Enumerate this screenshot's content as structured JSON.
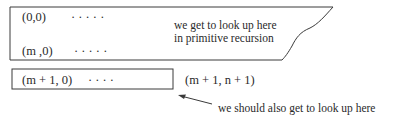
{
  "diagram": {
    "top_region": {
      "row_first": {
        "label": "(0,0)",
        "dots": "·   ·   ·   ·   ·"
      },
      "row_last": {
        "label": "(m ,0)",
        "dots": "·   ·   ·   ·   ·"
      },
      "annotation_line1": "we get to look up here",
      "annotation_line2": "in primitive recursion"
    },
    "bottom_row": {
      "label": "(m + 1, 0)",
      "dots": "·   ·   ·   ·",
      "target_label": "(m + 1, n + 1)"
    },
    "arrow_note": "we should also get to look up here",
    "colors": {
      "stroke": "#3a3a3a",
      "text": "#2a2a2a",
      "background": "#ffffff"
    }
  }
}
